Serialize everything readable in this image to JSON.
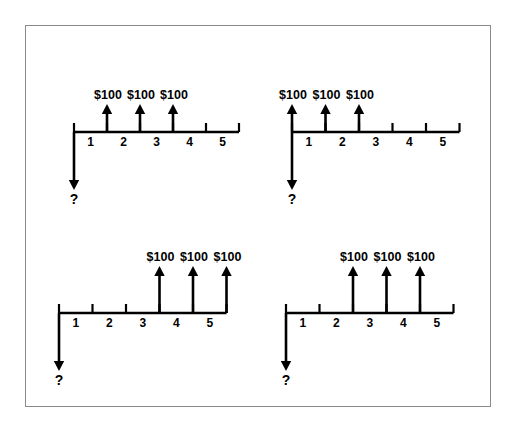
{
  "figure": {
    "title": "",
    "background_color": "#ffffff",
    "border_color": "#8a8a8a",
    "ink_color": "#000000",
    "unknown_symbol": "?",
    "cash_flow_label": "$100",
    "tick_labels": [
      "1",
      "2",
      "3",
      "4",
      "5"
    ]
  },
  "chart_data": {
    "type": "diagram",
    "xlabel": "Period",
    "ylabel": "",
    "axis_range": [
      0,
      5
    ],
    "tick_values": [
      0,
      1,
      2,
      3,
      4,
      5
    ],
    "tick_labels_between": [
      "1",
      "2",
      "3",
      "4",
      "5"
    ],
    "grid": false,
    "legend": "none",
    "panels": [
      {
        "id": "panel-a",
        "position": "top-left",
        "unknown_label": "?",
        "unknown_period": 0,
        "unknown_direction": "down",
        "cash_flows": [
          {
            "period": 1,
            "label": "$100",
            "amount": 100,
            "direction": "up"
          },
          {
            "period": 2,
            "label": "$100",
            "amount": 100,
            "direction": "up"
          },
          {
            "period": 3,
            "label": "$100",
            "amount": 100,
            "direction": "up"
          }
        ]
      },
      {
        "id": "panel-b",
        "position": "top-right",
        "unknown_label": "?",
        "unknown_period": 0,
        "unknown_direction": "down",
        "cash_flows": [
          {
            "period": 0,
            "label": "$100",
            "amount": 100,
            "direction": "up"
          },
          {
            "period": 1,
            "label": "$100",
            "amount": 100,
            "direction": "up"
          },
          {
            "period": 2,
            "label": "$100",
            "amount": 100,
            "direction": "up"
          }
        ]
      },
      {
        "id": "panel-c",
        "position": "bottom-left",
        "unknown_label": "?",
        "unknown_period": 0,
        "unknown_direction": "down",
        "cash_flows": [
          {
            "period": 3,
            "label": "$100",
            "amount": 100,
            "direction": "up"
          },
          {
            "period": 4,
            "label": "$100",
            "amount": 100,
            "direction": "up"
          },
          {
            "period": 5,
            "label": "$100",
            "amount": 100,
            "direction": "up"
          }
        ]
      },
      {
        "id": "panel-d",
        "position": "bottom-right",
        "unknown_label": "?",
        "unknown_period": 0,
        "unknown_direction": "down",
        "cash_flows": [
          {
            "period": 2,
            "label": "$100",
            "amount": 100,
            "direction": "up"
          },
          {
            "period": 3,
            "label": "$100",
            "amount": 100,
            "direction": "up"
          },
          {
            "period": 4,
            "label": "$100",
            "amount": 100,
            "direction": "up"
          }
        ]
      }
    ]
  }
}
